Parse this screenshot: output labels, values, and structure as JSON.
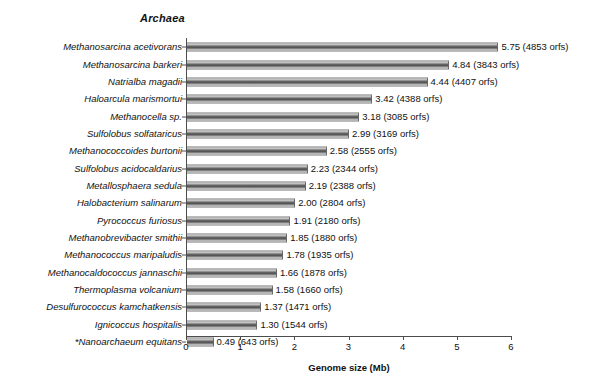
{
  "chart_data": {
    "type": "bar",
    "orientation": "horizontal",
    "title": "Archaea",
    "xlabel": "Genome size (Mb)",
    "ylabel": "",
    "xlim": [
      0,
      6
    ],
    "xticks": [
      "0",
      "1",
      "2",
      "3",
      "4",
      "5",
      "6"
    ],
    "grid": false,
    "legend": null,
    "categories": [
      "Methanosarcina acetivorans",
      "Methanosarcina barkeri",
      "Natrialba magadii",
      "Haloarcula marismortui",
      "Methanocella sp.",
      "Sulfolobus solfataricus",
      "Methanococcoides burtonii",
      "Sulfolobus acidocaldarius",
      "Metallosphaera sedula",
      "Halobacterium salinarum",
      "Pyrococcus furiosus",
      "Methanobrevibacter smithii",
      "Methanococcus maripaludis",
      "Methanocaldococcus jannaschii",
      "Thermoplasma volcanium",
      "Desulfurococcus kamchatkensis",
      "Ignicoccus hospitalis",
      "*Nanoarchaeum equitans"
    ],
    "values": [
      5.75,
      4.84,
      4.44,
      3.42,
      3.18,
      2.99,
      2.58,
      2.23,
      2.19,
      2.0,
      1.91,
      1.85,
      1.78,
      1.66,
      1.58,
      1.37,
      1.3,
      0.49
    ],
    "orfs": [
      4853,
      3843,
      4407,
      4388,
      3085,
      3169,
      2555,
      2344,
      2388,
      2804,
      2180,
      1880,
      1935,
      1878,
      1660,
      1471,
      1544,
      643
    ],
    "data_labels": [
      "5.75 (4853 orfs)",
      "4.84 (3843 orfs)",
      "4.44 (4407 orfs)",
      "3.42 (4388 orfs)",
      "3.18 (3085 orfs)",
      "2.99 (3169 orfs)",
      "2.58 (2555 orfs)",
      "2.23 (2344 orfs)",
      "2.19 (2388 orfs)",
      "2.00 (2804 orfs)",
      "1.91 (2180 orfs)",
      "1.85 (1880 orfs)",
      "1.78 (1935 orfs)",
      "1.66 (1878 orfs)",
      "1.58 (1660 orfs)",
      "1.37 (1471 orfs)",
      "1.30 (1544 orfs)",
      "0.49 (643 orfs)"
    ],
    "colors": {
      "bar_dark": "#4a4a4a",
      "bar_light": "#e8e8e8",
      "axis": "#4d4d4d",
      "text": "#111111",
      "background": "#ffffff"
    }
  }
}
